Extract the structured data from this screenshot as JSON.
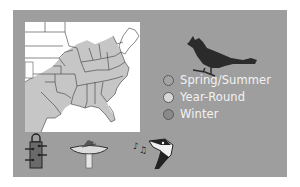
{
  "panel": {
    "background": "#9e9e9e"
  },
  "map": {
    "title": "Range map of eastern United States",
    "range_color": "#c6c6c6",
    "outside_color": "#ffffff",
    "border_color": "#3a3a3a"
  },
  "bird": {
    "name": "cardinal-silhouette",
    "color": "#2b2b2b"
  },
  "legend": {
    "items": [
      {
        "label": "Spring/Summer",
        "color": "#a3a3a3"
      },
      {
        "label": "Year-Round",
        "color": "#d4d4d4"
      },
      {
        "label": "Winter",
        "color": "#8a8a8a"
      }
    ]
  },
  "icons": [
    {
      "name": "tube-feeder-icon"
    },
    {
      "name": "bird-bath-icon"
    },
    {
      "name": "bird-song-icon"
    }
  ]
}
